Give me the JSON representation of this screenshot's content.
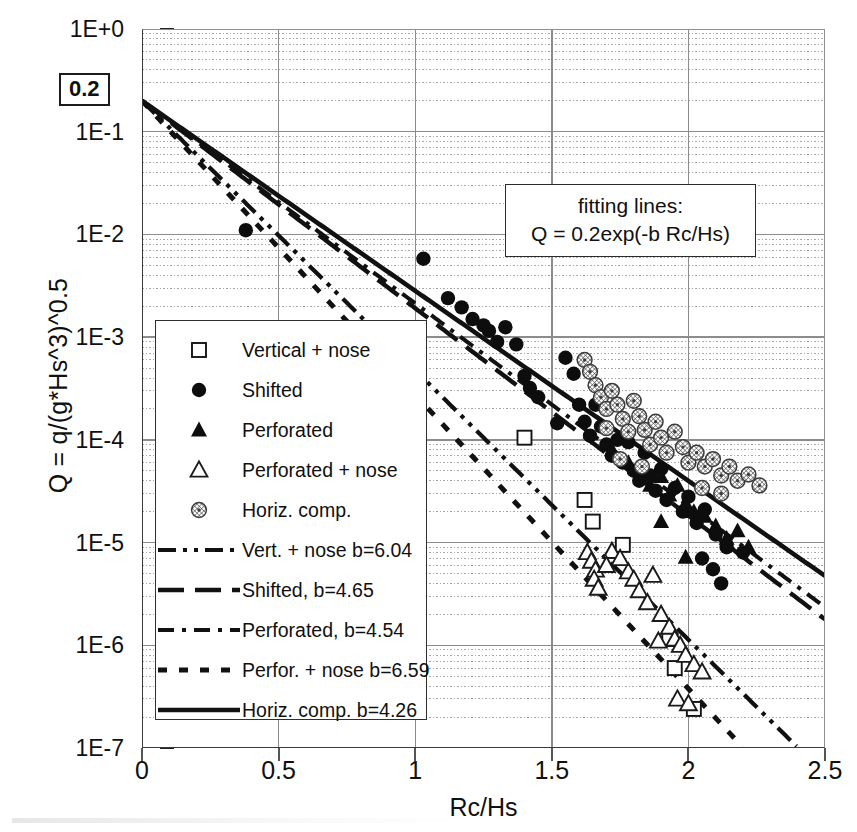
{
  "chart_data": {
    "type": "scatter",
    "title": "",
    "xlabel": "Rc/Hs",
    "ylabel": "Q = q/(g*Hs^3)^0.5",
    "xlim": [
      0,
      2.5
    ],
    "ylim_log": [
      -7,
      0
    ],
    "xticks": [
      "0",
      "0.5",
      "1",
      "1.5",
      "2",
      "2.5"
    ],
    "xtick_values": [
      0,
      0.5,
      1,
      1.5,
      2,
      2.5
    ],
    "yticks": [
      "1E+0",
      "1E-1",
      "1E-2",
      "1E-3",
      "1E-4",
      "1E-5",
      "1E-6",
      "1E-7"
    ],
    "ytick_exponents": [
      0,
      -1,
      -2,
      -3,
      -4,
      -5,
      -6,
      -7
    ],
    "grid": "major solid, minor log dotted",
    "legend_position": "lower-left inside axes",
    "annotation": {
      "line1": "fitting lines:",
      "line2": "Q = 0.2exp(-b Rc/Hs)"
    },
    "intercept_label": "0.2",
    "intercept_value": 0.2,
    "fit_formula": "Q = 0.2*exp(-b*Rc/Hs)",
    "fit_lines": [
      {
        "name": "Vert. + nose",
        "b": 6.04,
        "dash": "18,7,4,7,4,7",
        "width": 4.2
      },
      {
        "name": "Shifted",
        "b": 4.65,
        "dash": "26,11",
        "width": 4.4
      },
      {
        "name": "Perforated",
        "b": 4.54,
        "dash": "16,8,4,8",
        "width": 4.0
      },
      {
        "name": "Perfor. + nose",
        "b": 6.59,
        "dash": "9,12",
        "width": 5.0
      },
      {
        "name": "Horiz. comp.",
        "b": 4.26,
        "dash": "none",
        "width": 4.6
      }
    ],
    "series": [
      {
        "name": "Vertical + nose",
        "marker": "open-square",
        "points": [
          [
            1.4,
            0.000105
          ],
          [
            1.62,
            2.6e-05
          ],
          [
            1.65,
            1.6e-05
          ],
          [
            1.76,
            9.5e-06
          ],
          [
            1.93,
            1.15e-06
          ],
          [
            1.95,
            6e-07
          ],
          [
            2.02,
            2.4e-07
          ]
        ]
      },
      {
        "name": "Shifted",
        "marker": "filled-circle",
        "points": [
          [
            0.38,
            0.011
          ],
          [
            1.03,
            0.0058
          ],
          [
            1.12,
            0.0024
          ],
          [
            1.17,
            0.00195
          ],
          [
            1.21,
            0.0015
          ],
          [
            1.25,
            0.0013
          ],
          [
            1.27,
            0.00115
          ],
          [
            1.3,
            0.0009
          ],
          [
            1.33,
            0.00125
          ],
          [
            1.37,
            0.00085
          ],
          [
            1.4,
            0.00042
          ],
          [
            1.42,
            0.00032
          ],
          [
            1.45,
            0.00026
          ],
          [
            1.52,
            0.000145
          ],
          [
            1.55,
            0.00063
          ],
          [
            1.58,
            0.00044
          ],
          [
            1.6,
            0.00022
          ],
          [
            1.62,
            0.00015
          ],
          [
            1.64,
            0.00011
          ],
          [
            1.66,
            0.00022
          ],
          [
            1.68,
            0.000135
          ],
          [
            1.7,
            9e-05
          ],
          [
            1.72,
            7e-05
          ],
          [
            1.74,
            0.0001
          ],
          [
            1.76,
            6e-05
          ],
          [
            1.78,
            9.5e-05
          ],
          [
            1.8,
            5e-05
          ],
          [
            1.82,
            4e-05
          ],
          [
            1.84,
            7.5e-05
          ],
          [
            1.86,
            4.5e-05
          ],
          [
            1.88,
            3.2e-05
          ],
          [
            1.9,
            5.2e-05
          ],
          [
            1.92,
            2.6e-05
          ],
          [
            1.95,
            3.4e-05
          ],
          [
            1.98,
            2e-05
          ],
          [
            2.0,
            2.8e-05
          ],
          [
            2.03,
            1.55e-05
          ],
          [
            2.06,
            2.1e-05
          ],
          [
            2.1,
            1.2e-05
          ],
          [
            2.14,
            9e-06
          ],
          [
            2.05,
            7e-06
          ],
          [
            2.09,
            5.5e-06
          ],
          [
            2.12,
            4e-06
          ],
          [
            2.2,
            8e-06
          ]
        ]
      },
      {
        "name": "Perforated",
        "marker": "filled-triangle",
        "points": [
          [
            1.72,
            8e-05
          ],
          [
            1.78,
            6e-05
          ],
          [
            1.83,
            5e-05
          ],
          [
            1.86,
            3.6e-05
          ],
          [
            1.9,
            4.4e-05
          ],
          [
            1.93,
            2.9e-05
          ],
          [
            1.96,
            3.6e-05
          ],
          [
            1.99,
            2.4e-05
          ],
          [
            2.02,
            2e-05
          ],
          [
            2.06,
            1.8e-05
          ],
          [
            2.1,
            1.45e-05
          ],
          [
            2.14,
            1.1e-05
          ],
          [
            2.18,
            1.3e-05
          ],
          [
            2.22,
            9e-06
          ],
          [
            1.99,
            7.2e-06
          ],
          [
            1.9,
            1.6e-05
          ]
        ]
      },
      {
        "name": "Perforated + nose",
        "marker": "open-triangle",
        "points": [
          [
            1.63,
            8e-06
          ],
          [
            1.645,
            6.6e-06
          ],
          [
            1.66,
            5.4e-06
          ],
          [
            1.655,
            4.4e-06
          ],
          [
            1.67,
            3.6e-06
          ],
          [
            1.72,
            8.2e-06
          ],
          [
            1.78,
            5.2e-06
          ],
          [
            1.8,
            4.4e-06
          ],
          [
            1.82,
            3.4e-06
          ],
          [
            1.85,
            2.6e-06
          ],
          [
            1.87,
            4.8e-06
          ],
          [
            1.9,
            2e-06
          ],
          [
            1.93,
            1.5e-06
          ],
          [
            1.95,
            1.15e-06
          ],
          [
            1.97,
            1e-06
          ],
          [
            1.99,
            8e-07
          ],
          [
            2.02,
            6.5e-07
          ],
          [
            2.05,
            5.5e-07
          ],
          [
            1.89,
            1.1e-06
          ],
          [
            1.96,
            3e-07
          ],
          [
            2.0,
            2.7e-07
          ],
          [
            1.7,
            6e-06
          ],
          [
            1.75,
            7e-06
          ]
        ]
      },
      {
        "name": "Horiz. comp.",
        "marker": "hatched-circle",
        "points": [
          [
            1.62,
            0.0006
          ],
          [
            1.64,
            0.00046
          ],
          [
            1.66,
            0.00034
          ],
          [
            1.68,
            0.00026
          ],
          [
            1.7,
            0.0002
          ],
          [
            1.72,
            0.0003
          ],
          [
            1.74,
            0.00022
          ],
          [
            1.76,
            0.00016
          ],
          [
            1.78,
            0.00012
          ],
          [
            1.8,
            0.00024
          ],
          [
            1.82,
            0.00017
          ],
          [
            1.84,
            0.000125
          ],
          [
            1.86,
            9e-05
          ],
          [
            1.88,
            0.00015
          ],
          [
            1.9,
            0.000105
          ],
          [
            1.92,
            7.5e-05
          ],
          [
            1.95,
            0.00012
          ],
          [
            1.98,
            8.5e-05
          ],
          [
            2.0,
            6e-05
          ],
          [
            2.03,
            7.5e-05
          ],
          [
            2.06,
            5.5e-05
          ],
          [
            2.09,
            6.5e-05
          ],
          [
            2.12,
            4.5e-05
          ],
          [
            2.15,
            5.5e-05
          ],
          [
            2.18,
            4e-05
          ],
          [
            2.22,
            4.6e-05
          ],
          [
            2.26,
            3.6e-05
          ],
          [
            1.7,
            0.00013
          ],
          [
            1.75,
            6.5e-05
          ],
          [
            1.83,
            5.5e-05
          ],
          [
            2.05,
            3.4e-05
          ],
          [
            2.12,
            3e-05
          ]
        ]
      }
    ]
  },
  "legend": {
    "items": [
      {
        "label": "Vertical + nose",
        "kind": "marker",
        "marker": "open-square"
      },
      {
        "label": "Shifted",
        "kind": "marker",
        "marker": "filled-circle"
      },
      {
        "label": "Perforated",
        "kind": "marker",
        "marker": "filled-triangle"
      },
      {
        "label": "Perforated + nose",
        "kind": "marker",
        "marker": "open-triangle"
      },
      {
        "label": "Horiz. comp.",
        "kind": "marker",
        "marker": "hatched-circle"
      },
      {
        "label": "Vert. + nose b=6.04",
        "kind": "line",
        "dash": "18,7,4,7,4,7",
        "width": 4.2
      },
      {
        "label": "Shifted, b=4.65",
        "kind": "line",
        "dash": "26,11",
        "width": 4.4
      },
      {
        "label": "Perforated, b=4.54",
        "kind": "line",
        "dash": "16,8,4,8",
        "width": 4.0
      },
      {
        "label": "Perfor. + nose b=6.59",
        "kind": "line",
        "dash": "9,12",
        "width": 5.0
      },
      {
        "label": "Horiz. comp. b=4.26",
        "kind": "line",
        "dash": "none",
        "width": 4.6
      }
    ]
  },
  "colors": {
    "ink": "#101010",
    "grid_major": "#8c8c8c",
    "grid_minor": "#a8a8a8",
    "frame": "#3a3a3a",
    "background": "#ffffff"
  }
}
